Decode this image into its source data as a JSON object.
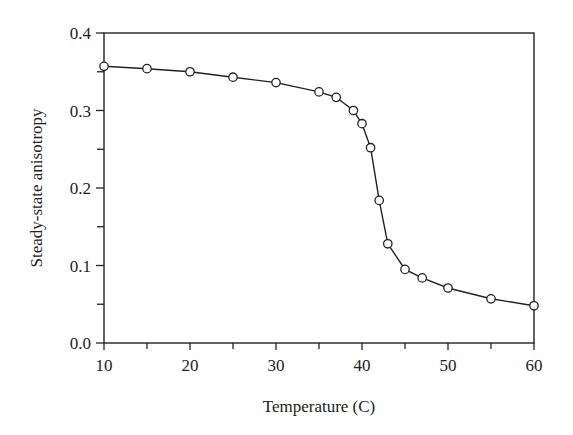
{
  "chart_data": {
    "type": "line",
    "title": "",
    "xlabel": "Temperature (C)",
    "ylabel": "Steady-state anisotropy",
    "xlim": [
      10,
      60
    ],
    "ylim": [
      0.0,
      0.4
    ],
    "x_ticks": [
      10,
      20,
      30,
      40,
      50,
      60
    ],
    "x_tick_labels": [
      "10",
      "20",
      "30",
      "40",
      "50",
      "60"
    ],
    "x_minor_ticks": [
      15,
      25,
      35,
      45,
      55
    ],
    "y_ticks": [
      0.0,
      0.1,
      0.2,
      0.3,
      0.4
    ],
    "y_tick_labels": [
      "0.0",
      "0.1",
      "0.2",
      "0.3",
      "0.4"
    ],
    "y_minor_ticks": [
      0.05,
      0.15,
      0.25,
      0.35
    ],
    "grid": false,
    "legend": null,
    "marker": "open-circle",
    "series": [
      {
        "name": "anisotropy",
        "x": [
          10,
          15,
          20,
          25,
          30,
          35,
          37,
          39,
          40,
          41,
          42,
          43,
          45,
          47,
          50,
          55,
          60
        ],
        "values": [
          0.357,
          0.354,
          0.35,
          0.343,
          0.336,
          0.324,
          0.317,
          0.3,
          0.283,
          0.252,
          0.184,
          0.128,
          0.095,
          0.084,
          0.071,
          0.057,
          0.048
        ]
      }
    ]
  },
  "colors": {
    "line": "#222222",
    "marker_fill": "#ffffff",
    "axis": "#222222"
  }
}
